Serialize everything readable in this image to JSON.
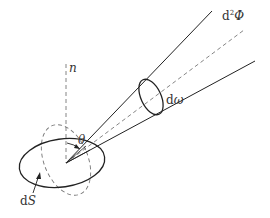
{
  "diagram": {
    "type": "radiometry-solid-angle",
    "labels": {
      "normal": "n",
      "theta": "θ",
      "solid_angle": "dω",
      "flux": "d²Φ",
      "area": "dS"
    },
    "labels_parts": {
      "flux_d": "d",
      "flux_sup": "2",
      "flux_phi": "Φ",
      "solid_d": "d",
      "solid_omega": "ω",
      "area_d": "d",
      "area_s": "S"
    },
    "colors": {
      "stroke": "#222222",
      "dashed": "#777777",
      "background": "#ffffff"
    }
  }
}
